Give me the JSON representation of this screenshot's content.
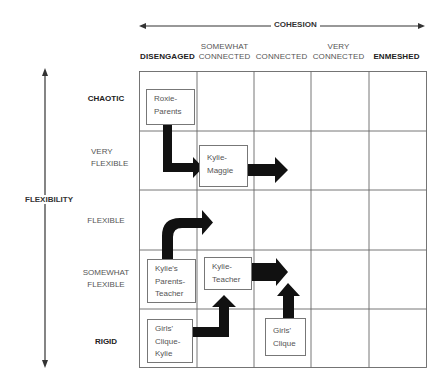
{
  "axes": {
    "cohesion": {
      "title": "COHESION"
    },
    "flexibility": {
      "title": "FLEXIBILITY"
    }
  },
  "columns": [
    {
      "label": "DISENGAGED",
      "bold": true
    },
    {
      "label": "SOMEWHAT CONNECTED",
      "line1": "SOMEWHAT",
      "line2": "CONNECTED",
      "bold": false
    },
    {
      "label": "CONNECTED",
      "bold": false
    },
    {
      "label": "VERY CONNECTED",
      "line1": "VERY",
      "line2": "CONNECTED",
      "bold": false
    },
    {
      "label": "ENMESHED",
      "bold": true
    }
  ],
  "rows": [
    {
      "label": "CHAOTIC",
      "bold": true
    },
    {
      "label": "VERY FLEXIBLE",
      "line1": "VERY",
      "line2": "FLEXIBLE",
      "bold": false
    },
    {
      "label": "FLEXIBLE",
      "bold": false
    },
    {
      "label": "SOMEWHAT FLEXIBLE",
      "line1": "SOMEWHAT",
      "line2": "FLEXIBLE",
      "bold": false
    },
    {
      "label": "RIGID",
      "bold": true
    }
  ],
  "nodes": [
    {
      "id": "roxie-parents",
      "lines": [
        "Roxie-",
        "Parents"
      ],
      "cohesion": "DISENGAGED",
      "flexibility": "CHAOTIC"
    },
    {
      "id": "kylie-maggie",
      "lines": [
        "Kylie-",
        "Maggie"
      ],
      "cohesion": "SOMEWHAT CONNECTED",
      "flexibility": "VERY FLEXIBLE"
    },
    {
      "id": "kylies-parents-teacher",
      "lines": [
        "Kylie's",
        "Parents-",
        "Teacher"
      ],
      "cohesion": "DISENGAGED",
      "flexibility": "SOMEWHAT FLEXIBLE"
    },
    {
      "id": "kylie-teacher",
      "lines": [
        "Kylie-",
        "Teacher"
      ],
      "cohesion": "SOMEWHAT CONNECTED",
      "flexibility": "SOMEWHAT FLEXIBLE"
    },
    {
      "id": "girls-clique-kylie",
      "lines": [
        "Girls'",
        "Clique-",
        "Kylie"
      ],
      "cohesion": "DISENGAGED",
      "flexibility": "RIGID"
    },
    {
      "id": "girls-clique",
      "lines": [
        "Girls'",
        "Clique"
      ],
      "cohesion": "CONNECTED",
      "flexibility": "RIGID"
    }
  ],
  "arrows": [
    {
      "from": "roxie-parents",
      "to": "kylie-maggie",
      "shape": "elbow-down-right"
    },
    {
      "from": "kylie-maggie",
      "to": "CONNECTED / VERY FLEXIBLE",
      "shape": "right"
    },
    {
      "from": "kylies-parents-teacher",
      "to": "SOMEWHAT CONNECTED / FLEXIBLE",
      "shape": "curve-up-right"
    },
    {
      "from": "kylie-teacher",
      "to": "CONNECTED / SOMEWHAT FLEXIBLE",
      "shape": "right"
    },
    {
      "from": "girls-clique-kylie",
      "to": "kylie-teacher",
      "shape": "elbow-right-up"
    },
    {
      "from": "girls-clique",
      "to": "CONNECTED / SOMEWHAT FLEXIBLE",
      "shape": "up"
    }
  ],
  "colors": {
    "grid": "#555555",
    "arrow": "#111111",
    "text": "#555555",
    "box_border": "#777777"
  }
}
